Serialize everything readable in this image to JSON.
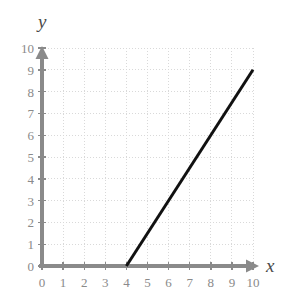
{
  "chart_data": {
    "type": "line",
    "title": "",
    "xlabel": "x",
    "ylabel": "y",
    "xlim": [
      0,
      10
    ],
    "ylim": [
      0,
      10
    ],
    "grid": true,
    "legend": null,
    "x_ticks": [
      0,
      1,
      2,
      3,
      4,
      5,
      6,
      7,
      8,
      9,
      10
    ],
    "y_ticks": [
      0,
      1,
      2,
      3,
      4,
      5,
      6,
      7,
      8,
      9,
      10
    ],
    "x_tick_labels": [
      "0",
      "1",
      "2",
      "3",
      "4",
      "5",
      "6",
      "7",
      "8",
      "9",
      "10"
    ],
    "y_tick_labels": [
      "0",
      "1",
      "2",
      "3",
      "4",
      "5",
      "6",
      "7",
      "8",
      "9",
      "10"
    ],
    "series": [
      {
        "name": "line-segment",
        "points": [
          [
            4,
            0
          ],
          [
            10,
            9
          ]
        ],
        "x": [
          4,
          10
        ],
        "values": [
          0,
          9
        ],
        "color": "#111111",
        "width": 3
      }
    ],
    "colors": {
      "line": "#111111",
      "axis": "#8a8a8a",
      "grid": "#d9d9d9",
      "tick_text": "#8a8a8a",
      "axis_name": "#4a4a4a",
      "background": "#ffffff"
    }
  },
  "axis_labels": {
    "x": "x",
    "y": "y"
  }
}
